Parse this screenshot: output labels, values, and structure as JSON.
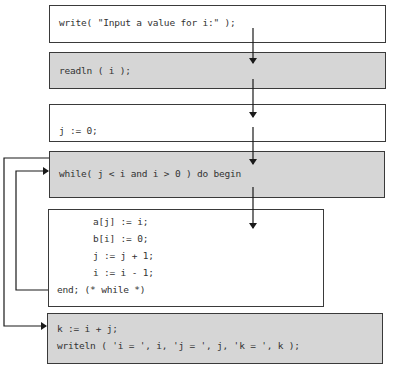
{
  "colors": {
    "border": "#3a3a3a",
    "gray_fill": "#d6d6d6",
    "white_fill": "#ffffff",
    "text": "#333333",
    "arrow": "#1a1a1a"
  },
  "blocks": [
    {
      "id": "write-prompt",
      "fill": "white",
      "lines": [
        "write( \"Input a value for i:\" );"
      ]
    },
    {
      "id": "readln",
      "fill": "gray",
      "lines": [
        "readln ( i );"
      ]
    },
    {
      "id": "init-j",
      "fill": "white",
      "lines": [
        "j := 0;"
      ]
    },
    {
      "id": "while-header",
      "fill": "gray",
      "lines": [
        "while( j < i and i > 0 ) do begin"
      ]
    },
    {
      "id": "loop-body",
      "fill": "white",
      "lines": [
        "a[j] := i;",
        "b[i] := 0;",
        "j := j + 1;",
        "i := i - 1;",
        "end; (* while *)"
      ]
    },
    {
      "id": "output",
      "fill": "gray",
      "lines": [
        "k := i + j;",
        "writeln ( 'i = ', i, 'j = ', j, 'k = ', k );"
      ]
    }
  ],
  "edges": [
    {
      "from": "write-prompt",
      "to": "readln",
      "type": "sequence"
    },
    {
      "from": "readln",
      "to": "init-j",
      "type": "sequence"
    },
    {
      "from": "init-j",
      "to": "while-header",
      "type": "sequence"
    },
    {
      "from": "while-header",
      "to": "loop-body",
      "type": "condition-true"
    },
    {
      "from": "loop-body",
      "to": "while-header",
      "type": "loop-back"
    },
    {
      "from": "while-header",
      "to": "output",
      "type": "condition-false-exit"
    }
  ]
}
